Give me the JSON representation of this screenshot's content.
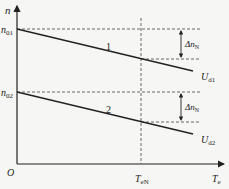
{
  "diagram": {
    "type": "mechanical characteristic curves",
    "axes": {
      "y_label": "n",
      "x_label": "T",
      "x_label_sub": "e",
      "origin": "O"
    },
    "y_ticks": [
      {
        "label": "n",
        "sub": "01"
      },
      {
        "label": "n",
        "sub": "02"
      }
    ],
    "x_ticks": [
      {
        "label": "T",
        "sub": "eN"
      }
    ],
    "lines": [
      {
        "id": "1",
        "label": "1",
        "voltage": "U",
        "voltage_sub": "d1"
      },
      {
        "id": "2",
        "label": "2",
        "voltage": "U",
        "voltage_sub": "d2"
      }
    ],
    "annotations": [
      {
        "label": "Δn",
        "sub": "N"
      },
      {
        "label": "Δn",
        "sub": "N"
      }
    ]
  }
}
